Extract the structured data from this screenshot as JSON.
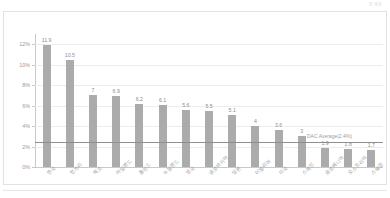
{
  "header": {
    "corner_note": "통계청"
  },
  "chart_data": {
    "type": "bar",
    "title": "",
    "subtitle": "",
    "xlabel": "",
    "ylabel": "",
    "ylim": [
      0,
      13
    ],
    "grid": true,
    "legend": "none",
    "ytick_labels": [
      "0%",
      "2%",
      "4%",
      "6%",
      "8%",
      "10%",
      "12%"
    ],
    "ytick_values": [
      0,
      2,
      4,
      6,
      8,
      10,
      12
    ],
    "categories": [
      "한국",
      "헝가리",
      "체코",
      "아일랜드",
      "폴란드",
      "뉴질랜드",
      "영국",
      "슬로바키아",
      "일본",
      "이탈리아",
      "미국",
      "스페인",
      "슬로베니아",
      "오스트리아",
      "스웨덴"
    ],
    "values": [
      11.9,
      10.5,
      7,
      6.9,
      6.2,
      6.1,
      5.6,
      5.5,
      5.1,
      4,
      3.6,
      3,
      1.9,
      1.8,
      1.7
    ],
    "value_labels": [
      "11.9",
      "10.5",
      "7",
      "6.9",
      "6.2",
      "6.1",
      "5.6",
      "5.5",
      "5.1",
      "4",
      "3.6",
      "3",
      "1.9",
      "1.8",
      "1.7"
    ],
    "reference_line": {
      "label": "DAC Average(2.4%)",
      "value": 2.4
    },
    "colors": {
      "bar": "#ababab",
      "reference_line": "#8f8f8f",
      "grid": "#ededed",
      "axis": "#c9c9c9",
      "text": "#9a9a9a",
      "background": "#ffffff",
      "card_border": "#e2e2e2"
    }
  }
}
